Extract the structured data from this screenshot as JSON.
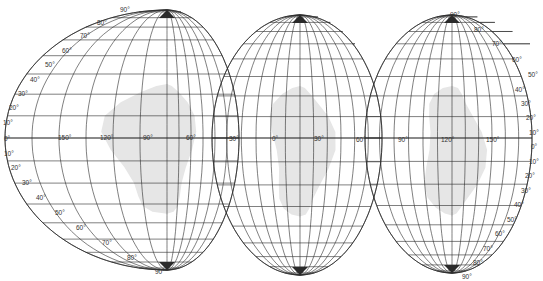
{
  "figure": {
    "type": "interrupted-map-projection-graticule",
    "colors": {
      "line": "#2a2a2a",
      "land": "#e6e6e6",
      "background": "#ffffff",
      "label": "#333333"
    },
    "lobes": [
      {
        "id": "americas",
        "cx": 167,
        "top_y": 10,
        "bottom_y": 270,
        "equator_y": 138,
        "left_half_width": 162,
        "right_half_width": 72,
        "top_cut_latitude": 50,
        "top_cut_right_x": 210
      },
      {
        "id": "europe-africa",
        "cx": 300,
        "top_y": 15,
        "bottom_y": 275,
        "equator_y": 138,
        "left_half_width": 88,
        "right_half_width": 82,
        "top_cut_latitude": 50,
        "top_cut_right_x": 355
      },
      {
        "id": "asia-australia",
        "cx": 452,
        "top_y": 15,
        "bottom_y": 273,
        "equator_y": 138,
        "left_half_width": 87,
        "right_half_width": 80,
        "top_cut_latitude": 50,
        "top_cut_right_x": 530
      }
    ],
    "longitude_labels": [
      {
        "text": "150°",
        "x": 58,
        "y": 140
      },
      {
        "text": "120°",
        "x": 100,
        "y": 140
      },
      {
        "text": "90°",
        "x": 143,
        "y": 140
      },
      {
        "text": "60°",
        "x": 186,
        "y": 140
      },
      {
        "text": "30°",
        "x": 229,
        "y": 141
      },
      {
        "text": "0°",
        "x": 272,
        "y": 141
      },
      {
        "text": "30°",
        "x": 314,
        "y": 141
      },
      {
        "text": "60°",
        "x": 356,
        "y": 142
      },
      {
        "text": "90°",
        "x": 398,
        "y": 142
      },
      {
        "text": "120°",
        "x": 441,
        "y": 142
      },
      {
        "text": "150°",
        "x": 486,
        "y": 142
      }
    ],
    "left_latitude_labels": [
      {
        "text": "90°",
        "x": 120,
        "y": 12
      },
      {
        "text": "80°",
        "x": 97,
        "y": 25
      },
      {
        "text": "70°",
        "x": 80,
        "y": 38
      },
      {
        "text": "60°",
        "x": 62,
        "y": 53
      },
      {
        "text": "50°",
        "x": 45,
        "y": 67
      },
      {
        "text": "40°",
        "x": 30,
        "y": 82
      },
      {
        "text": "30°",
        "x": 18,
        "y": 96
      },
      {
        "text": "20°",
        "x": 9,
        "y": 110
      },
      {
        "text": "10°",
        "x": 3,
        "y": 125
      },
      {
        "text": "0°",
        "x": 4,
        "y": 141
      },
      {
        "text": "10°",
        "x": 4,
        "y": 156
      },
      {
        "text": "20°",
        "x": 11,
        "y": 170
      },
      {
        "text": "30°",
        "x": 22,
        "y": 185
      },
      {
        "text": "40°",
        "x": 36,
        "y": 200
      },
      {
        "text": "50°",
        "x": 55,
        "y": 215
      },
      {
        "text": "60°",
        "x": 76,
        "y": 230
      },
      {
        "text": "70°",
        "x": 102,
        "y": 245
      },
      {
        "text": "80°",
        "x": 127,
        "y": 260
      },
      {
        "text": "90°",
        "x": 155,
        "y": 274
      }
    ],
    "right_latitude_labels": [
      {
        "text": "90°",
        "x": 450,
        "y": 17
      },
      {
        "text": "80°",
        "x": 474,
        "y": 32
      },
      {
        "text": "70°",
        "x": 492,
        "y": 46
      },
      {
        "text": "60°",
        "x": 512,
        "y": 62
      },
      {
        "text": "50°",
        "x": 528,
        "y": 77
      },
      {
        "text": "40°",
        "x": 515,
        "y": 92
      },
      {
        "text": "30°",
        "x": 521,
        "y": 106
      },
      {
        "text": "20°",
        "x": 526,
        "y": 120
      },
      {
        "text": "10°",
        "x": 529,
        "y": 135
      },
      {
        "text": "0°",
        "x": 531,
        "y": 149
      },
      {
        "text": "10°",
        "x": 529,
        "y": 164
      },
      {
        "text": "20°",
        "x": 525,
        "y": 178
      },
      {
        "text": "30°",
        "x": 521,
        "y": 193
      },
      {
        "text": "40°",
        "x": 514,
        "y": 207
      },
      {
        "text": "50°",
        "x": 507,
        "y": 222
      },
      {
        "text": "60°",
        "x": 495,
        "y": 236
      },
      {
        "text": "70°",
        "x": 483,
        "y": 251
      },
      {
        "text": "80°",
        "x": 473,
        "y": 265
      },
      {
        "text": "90°",
        "x": 462,
        "y": 279
      }
    ]
  }
}
